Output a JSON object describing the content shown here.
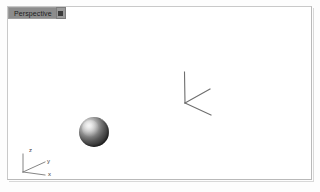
{
  "app": {
    "background_color": "#fdfdfd"
  },
  "viewport": {
    "name": "Perspective",
    "menu_button_icon": "viewport-menu-icon",
    "border_color": "#b9b9b9",
    "background_color": "#ffffff",
    "label_background_color": "#8c8c8c"
  },
  "scene": {
    "objects": [
      {
        "name": "sphere",
        "label": "Sphere",
        "shading": "smooth-shaded",
        "highlight_color": "#ededed",
        "shadow_color": "#1e1e1e"
      },
      {
        "name": "wireframe",
        "label": "Wireframe",
        "shading": "wireframe",
        "line_color": "#6e6e6e"
      }
    ]
  },
  "axis_gizmo": {
    "name": "world-axis-indicator",
    "labels": {
      "z": "z",
      "y": "y",
      "x": "x"
    },
    "line_color": "#777777",
    "text_color": "#3a3a3a"
  }
}
